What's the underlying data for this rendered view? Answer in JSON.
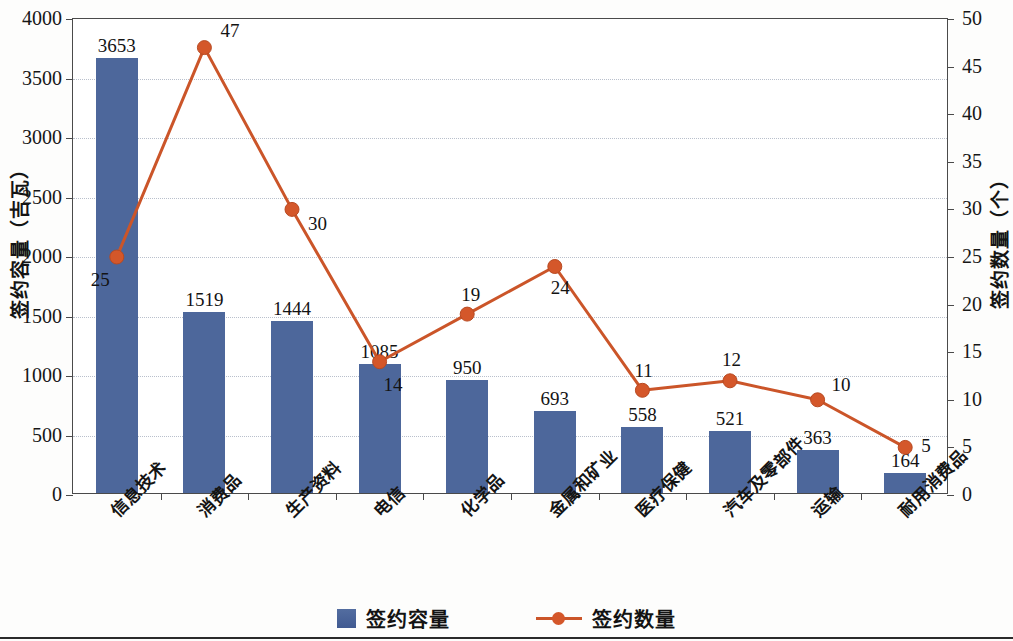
{
  "chart_data": {
    "type": "bar",
    "title": "",
    "subtitle": "",
    "xlabel": "",
    "ylabel": "签约容量（吉瓦）",
    "y2label": "签约数量（个）",
    "categories": [
      "信息技术",
      "消费品",
      "生产资料",
      "电信",
      "化学品",
      "金属和矿业",
      "医疗保健",
      "汽车及零部件",
      "运输",
      "耐用消费品"
    ],
    "series": [
      {
        "name": "签约容量",
        "type": "bar",
        "axis": "left",
        "color": "#4d679b",
        "values": [
          3653,
          1519,
          1444,
          1085,
          950,
          693,
          558,
          521,
          363,
          164
        ]
      },
      {
        "name": "签约数量",
        "type": "line",
        "axis": "right",
        "color": "#cb5529",
        "values": [
          25,
          47,
          30,
          14,
          19,
          24,
          11,
          12,
          10,
          5
        ]
      }
    ],
    "ylim": [
      0,
      4000
    ],
    "yticks": [
      0,
      500,
      1000,
      1500,
      2000,
      2500,
      3000,
      3500,
      4000
    ],
    "y2lim": [
      0,
      50
    ],
    "y2ticks": [
      0,
      5,
      10,
      15,
      20,
      25,
      30,
      35,
      40,
      45,
      50
    ],
    "grid": true,
    "legend_position": "bottom"
  },
  "legend": {
    "items": [
      {
        "label": "签约容量",
        "marker": "square-swatch-icon"
      },
      {
        "label": "签约数量",
        "marker": "line-marker-icon"
      }
    ]
  },
  "axes": {
    "left_title": "签约容量（吉瓦）",
    "right_title": "签约数量（个）"
  }
}
